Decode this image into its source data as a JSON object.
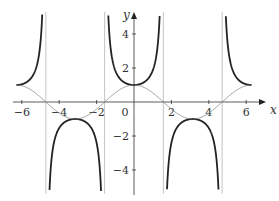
{
  "chart_data": {
    "type": "line",
    "title": "",
    "xlabel": "x",
    "ylabel": "y",
    "xlim": [
      -6.3,
      6.9
    ],
    "ylim": [
      -5.4,
      5.3
    ],
    "grid": false,
    "legend": null,
    "x_ticks": [
      -6,
      -4,
      -2,
      0,
      2,
      4,
      6
    ],
    "x_tick_labels": [
      "−6",
      "−4",
      "−2",
      "0",
      "2",
      "4",
      "6"
    ],
    "y_ticks": [
      -4,
      -2,
      2,
      4
    ],
    "y_tick_labels": [
      "−4",
      "−2",
      "2",
      "4"
    ],
    "series": [
      {
        "name": "y = sec x",
        "function": "sec",
        "domain": [
          -6.283,
          6.283
        ],
        "color": "#222222",
        "stroke_width": 1.8,
        "samples": {
          "x": [
            -6.28,
            -5.5,
            -5.0,
            -4.712,
            -4.4,
            -3.5,
            -3.14,
            -2.8,
            -2.0,
            -1.571,
            -1.2,
            -0.5,
            0,
            0.5,
            1.2,
            1.571,
            2.0,
            2.8,
            3.14,
            3.5,
            4.4,
            4.712,
            5.0,
            5.5,
            6.28
          ],
          "y": [
            1.0,
            1.41,
            3.53,
            null,
            -3.25,
            -1.07,
            -1.0,
            -1.06,
            -2.4,
            null,
            2.76,
            1.14,
            1.0,
            1.14,
            2.76,
            null,
            -2.4,
            -1.06,
            -1.0,
            -1.07,
            -3.25,
            null,
            3.53,
            1.41,
            1.0
          ]
        }
      },
      {
        "name": "y = cos x",
        "function": "cos",
        "domain": [
          -6.283,
          6.283
        ],
        "color": "#888888",
        "stroke_width": 0.9,
        "samples": {
          "x": [
            -6.28,
            -4.712,
            -3.14,
            -1.571,
            0,
            1.571,
            3.14,
            4.712,
            6.28
          ],
          "y": [
            1.0,
            0.0,
            -1.0,
            0.0,
            1.0,
            0.0,
            -1.0,
            0.0,
            1.0
          ]
        }
      }
    ],
    "asymptotes": {
      "x": [
        -4.712,
        -1.571,
        1.571,
        4.712
      ],
      "color": "#aaaaaa"
    }
  },
  "layout": {
    "origin_px": [
      134,
      102
    ],
    "x_unit_px": 18.7,
    "y_unit_px": 17,
    "x_axis_px": [
      13,
      266
    ],
    "y_axis_px": [
      195,
      12
    ]
  }
}
